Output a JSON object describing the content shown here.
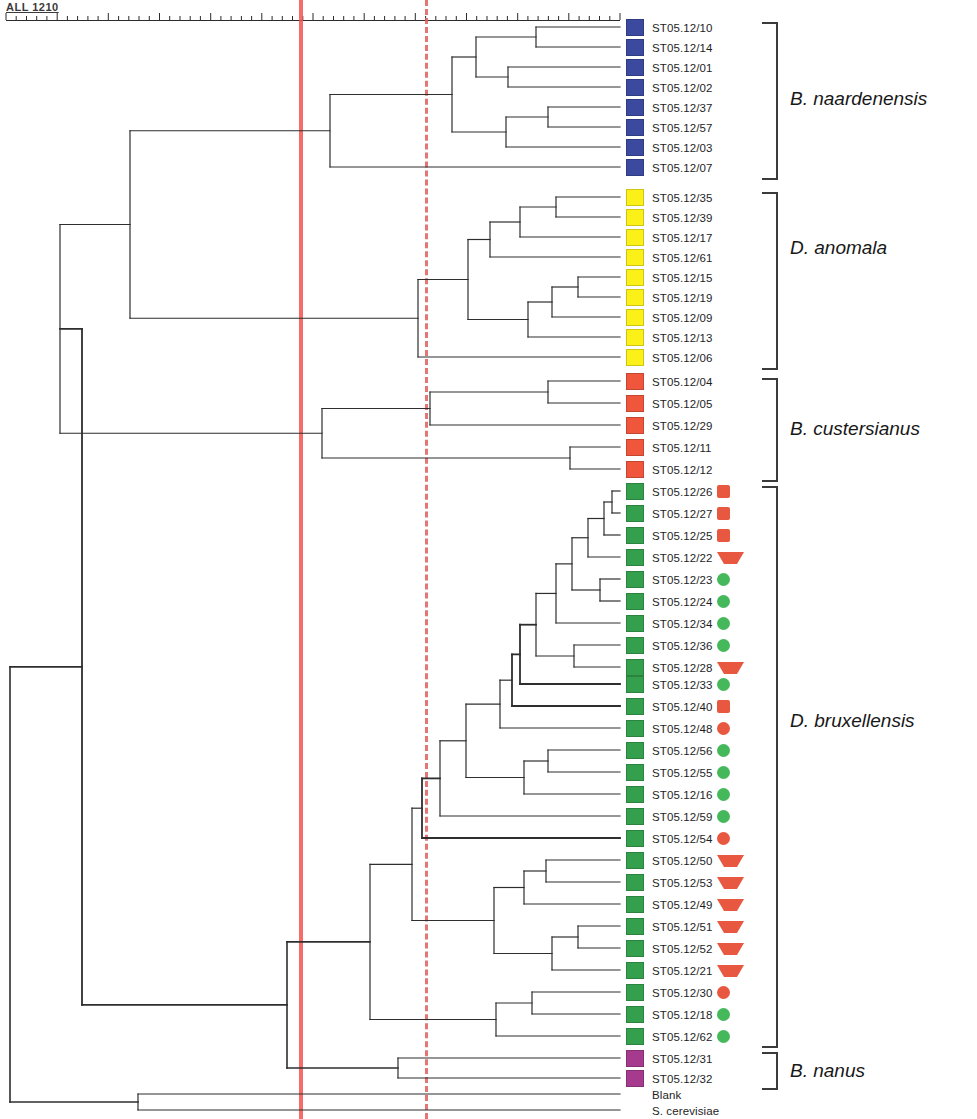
{
  "axis": {
    "label": "ALL 1210",
    "tick_count": 61,
    "x_start": 6,
    "x_end": 620
  },
  "reference_lines": {
    "solid": {
      "x": 299,
      "color": "#f4524d",
      "style": "solid"
    },
    "dashed": {
      "x": 425,
      "color": "#e0605e",
      "style": "dashed"
    }
  },
  "palette": {
    "blue": "#3b4a9e",
    "yellow": "#fbf018",
    "orange": "#f0563c",
    "green": "#34a04e",
    "magenta": "#a63a8e",
    "marker_red": "#e8573f",
    "marker_green": "#46b85c"
  },
  "leaves": [
    {
      "label": "ST05.12/10",
      "color": "blue",
      "marker": null,
      "y": 27
    },
    {
      "label": "ST05.12/14",
      "color": "blue",
      "marker": null,
      "y": 47
    },
    {
      "label": "ST05.12/01",
      "color": "blue",
      "marker": null,
      "y": 67
    },
    {
      "label": "ST05.12/02",
      "color": "blue",
      "marker": null,
      "y": 87
    },
    {
      "label": "ST05.12/37",
      "color": "blue",
      "marker": null,
      "y": 107
    },
    {
      "label": "ST05.12/57",
      "color": "blue",
      "marker": null,
      "y": 127
    },
    {
      "label": "ST05.12/03",
      "color": "blue",
      "marker": null,
      "y": 147
    },
    {
      "label": "ST05.12/07",
      "color": "blue",
      "marker": null,
      "y": 167
    },
    {
      "label": "ST05.12/35",
      "color": "yellow",
      "marker": null,
      "y": 197
    },
    {
      "label": "ST05.12/39",
      "color": "yellow",
      "marker": null,
      "y": 217
    },
    {
      "label": "ST05.12/17",
      "color": "yellow",
      "marker": null,
      "y": 237
    },
    {
      "label": "ST05.12/61",
      "color": "yellow",
      "marker": null,
      "y": 257
    },
    {
      "label": "ST05.12/15",
      "color": "yellow",
      "marker": null,
      "y": 277
    },
    {
      "label": "ST05.12/19",
      "color": "yellow",
      "marker": null,
      "y": 297
    },
    {
      "label": "ST05.12/09",
      "color": "yellow",
      "marker": null,
      "y": 317
    },
    {
      "label": "ST05.12/13",
      "color": "yellow",
      "marker": null,
      "y": 337
    },
    {
      "label": "ST05.12/06",
      "color": "yellow",
      "marker": null,
      "y": 357
    },
    {
      "label": "ST05.12/04",
      "color": "orange",
      "marker": null,
      "y": 381
    },
    {
      "label": "ST05.12/05",
      "color": "orange",
      "marker": null,
      "y": 403
    },
    {
      "label": "ST05.12/29",
      "color": "orange",
      "marker": null,
      "y": 425
    },
    {
      "label": "ST05.12/11",
      "color": "orange",
      "marker": null,
      "y": 447
    },
    {
      "label": "ST05.12/12",
      "color": "orange",
      "marker": null,
      "y": 469
    },
    {
      "label": "ST05.12/26",
      "color": "green",
      "marker": "red-square",
      "y": 491
    },
    {
      "label": "ST05.12/27",
      "color": "green",
      "marker": "red-square",
      "y": 513
    },
    {
      "label": "ST05.12/25",
      "color": "green",
      "marker": "red-square",
      "y": 535
    },
    {
      "label": "ST05.12/22",
      "color": "green",
      "marker": "red-triangle",
      "y": 557
    },
    {
      "label": "ST05.12/23",
      "color": "green",
      "marker": "green-circle",
      "y": 579
    },
    {
      "label": "ST05.12/24",
      "color": "green",
      "marker": "green-circle",
      "y": 601
    },
    {
      "label": "ST05.12/34",
      "color": "green",
      "marker": "green-circle",
      "y": 623
    },
    {
      "label": "ST05.12/36",
      "color": "green",
      "marker": "green-circle",
      "y": 645
    },
    {
      "label": "ST05.12/28",
      "color": "green",
      "marker": "red-triangle",
      "y": 667
    },
    {
      "label": "ST05.12/33",
      "color": "green",
      "marker": "green-circle",
      "y": 684
    },
    {
      "label": "ST05.12/40",
      "color": "green",
      "marker": "red-square",
      "y": 706
    },
    {
      "label": "ST05.12/48",
      "color": "green",
      "marker": "red-circle",
      "y": 728
    },
    {
      "label": "ST05.12/56",
      "color": "green",
      "marker": "green-circle",
      "y": 750
    },
    {
      "label": "ST05.12/55",
      "color": "green",
      "marker": "green-circle",
      "y": 772
    },
    {
      "label": "ST05.12/16",
      "color": "green",
      "marker": "green-circle",
      "y": 794
    },
    {
      "label": "ST05.12/59",
      "color": "green",
      "marker": "green-circle",
      "y": 816
    },
    {
      "label": "ST05.12/54",
      "color": "green",
      "marker": "red-circle",
      "y": 838
    },
    {
      "label": "ST05.12/50",
      "color": "green",
      "marker": "red-triangle",
      "y": 860
    },
    {
      "label": "ST05.12/53",
      "color": "green",
      "marker": "red-triangle",
      "y": 882
    },
    {
      "label": "ST05.12/49",
      "color": "green",
      "marker": "red-triangle",
      "y": 904
    },
    {
      "label": "ST05.12/51",
      "color": "green",
      "marker": "red-triangle",
      "y": 926
    },
    {
      "label": "ST05.12/52",
      "color": "green",
      "marker": "red-triangle",
      "y": 948
    },
    {
      "label": "ST05.12/21",
      "color": "green",
      "marker": "red-triangle",
      "y": 970
    },
    {
      "label": "ST05.12/30",
      "color": "green",
      "marker": "red-circle",
      "y": 992
    },
    {
      "label": "ST05.12/18",
      "color": "green",
      "marker": "green-circle",
      "y": 1014
    },
    {
      "label": "ST05.12/62",
      "color": "green",
      "marker": "green-circle",
      "y": 1036
    },
    {
      "label": "ST05.12/31",
      "color": "magenta",
      "marker": null,
      "y": 1058
    },
    {
      "label": "ST05.12/32",
      "color": "magenta",
      "marker": null,
      "y": 1078
    },
    {
      "label": "Blank",
      "color": "none",
      "marker": null,
      "y": 1094
    },
    {
      "label": "S. cerevisiae",
      "color": "none",
      "marker": null,
      "y": 1110
    }
  ],
  "groups": [
    {
      "name": "B. naardenensis",
      "top": 22,
      "bottom": 180,
      "label_y": 88
    },
    {
      "name": "D. anomala",
      "top": 192,
      "bottom": 370,
      "label_y": 237
    },
    {
      "name": "B. custersianus",
      "top": 378,
      "bottom": 482,
      "label_y": 418
    },
    {
      "name": "D. bruxellensis",
      "top": 486,
      "bottom": 1048,
      "label_y": 710
    },
    {
      "name": "B. nanus",
      "top": 1052,
      "bottom": 1090,
      "label_y": 1060
    }
  ]
}
